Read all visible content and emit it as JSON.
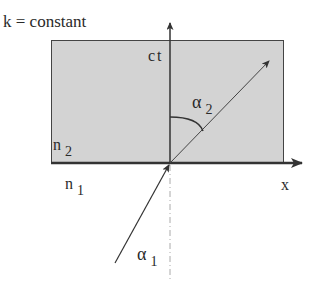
{
  "title": "k = constant",
  "axes": {
    "vertical_label": "ct",
    "horizontal_label": "x"
  },
  "media": {
    "upper": {
      "symbol": "n",
      "index": "2",
      "fill": "#d3d3d3"
    },
    "lower": {
      "symbol": "n",
      "index": "1",
      "fill": "#ffffff"
    }
  },
  "angles": {
    "refracted": {
      "symbol": "α",
      "index": "2"
    },
    "incident": {
      "symbol": "α",
      "index": "1"
    }
  },
  "colors": {
    "line": "#333333",
    "region": "#d3d3d3",
    "dotted": "#aaaaaa"
  }
}
